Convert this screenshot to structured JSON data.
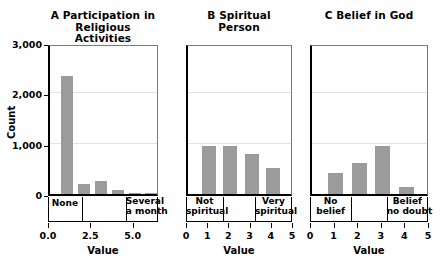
{
  "figure": {
    "background": "#ffffff",
    "bar_color": "#9b9b9b",
    "axis_color": "#000000",
    "grid_color": "#e2e2e2"
  },
  "chart_data": [
    {
      "type": "bar",
      "panel": "A",
      "title_letter": "A",
      "title": "Participation in\nReligious Activities",
      "title_line1": "A  Participation in",
      "title_line2": "Religious Activities",
      "xlabel": "Value",
      "ylabel": "Count",
      "ylim": [
        0,
        3000
      ],
      "xlim": [
        0,
        6.5
      ],
      "yticks": [
        0,
        1000,
        2000,
        3000
      ],
      "ytick_labels": [
        "0",
        "1,000",
        "2,000",
        "3,000"
      ],
      "xticks": [
        0.0,
        2.5,
        5.0
      ],
      "xtick_labels": [
        "0.0",
        "2.5",
        "5.0"
      ],
      "grid": true,
      "x": [
        1,
        2,
        3,
        4,
        5,
        6
      ],
      "values": [
        2350,
        200,
        260,
        75,
        20,
        10
      ],
      "bar_width": 0.72,
      "category_brackets": [
        {
          "label_line1": "None",
          "label_line2": "",
          "from": 0.0,
          "to": 2.0
        },
        {
          "label_line1": "Several",
          "label_line2": "a month",
          "from": 4.6,
          "to": 6.5
        }
      ],
      "bracket_dividers": [
        2.0,
        4.6
      ]
    },
    {
      "type": "bar",
      "panel": "B",
      "title_letter": "B",
      "title": "Spiritual Person",
      "title_line1": "B  Spiritual Person",
      "title_line2": "",
      "xlabel": "Value",
      "ylabel": "",
      "ylim": [
        0,
        3000
      ],
      "xlim": [
        0,
        5
      ],
      "yticks": [
        0,
        1000,
        2000,
        3000
      ],
      "ytick_labels": [
        "0",
        "1,000",
        "2,000",
        "3,000"
      ],
      "xticks": [
        0,
        1,
        2,
        3,
        4,
        5
      ],
      "xtick_labels": [
        "0",
        "1",
        "2",
        "3",
        "4",
        "5"
      ],
      "grid": true,
      "x": [
        1,
        2,
        3,
        4
      ],
      "values": [
        960,
        960,
        790,
        520
      ],
      "bar_width": 0.66,
      "category_brackets": [
        {
          "label_line1": "Not",
          "label_line2": "spiritual",
          "from": 0.0,
          "to": 1.75
        },
        {
          "label_line1": "Very",
          "label_line2": "spiritual",
          "from": 3.25,
          "to": 5.0
        }
      ],
      "bracket_dividers": [
        1.75,
        3.25
      ]
    },
    {
      "type": "bar",
      "panel": "C",
      "title_letter": "C",
      "title": "Belief in God",
      "title_line1": "C  Belief in God",
      "title_line2": "",
      "xlabel": "Value",
      "ylabel": "",
      "ylim": [
        0,
        3000
      ],
      "xlim": [
        0,
        5
      ],
      "yticks": [
        0,
        1000,
        2000,
        3000
      ],
      "ytick_labels": [
        "0",
        "1,000",
        "2,000",
        "3,000"
      ],
      "xticks": [
        0,
        1,
        2,
        3,
        4,
        5
      ],
      "xtick_labels": [
        "0",
        "1",
        "2",
        "3",
        "4",
        "5"
      ],
      "grid": true,
      "x": [
        1,
        2,
        3,
        4
      ],
      "values": [
        420,
        620,
        960,
        140
      ],
      "bar_width": 0.62,
      "category_brackets": [
        {
          "label_line1": "No",
          "label_line2": "belief",
          "from": 0.0,
          "to": 1.75
        },
        {
          "label_line1": "Belief",
          "label_line2": "no doubt",
          "from": 3.25,
          "to": 5.0
        }
      ],
      "bracket_dividers": [
        1.75,
        3.25
      ]
    }
  ]
}
